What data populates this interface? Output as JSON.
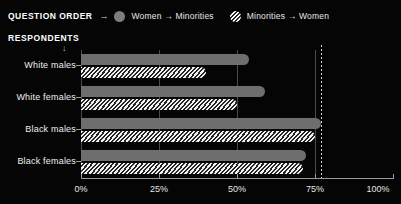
{
  "legend": {
    "title": "QUESTION ORDER",
    "arrow_icon": "→",
    "items": [
      {
        "label": "Women → Minorities",
        "swatch": "solid-circle",
        "color": "#7d7d7d"
      },
      {
        "label": "Minorities → Women",
        "swatch": "hatched-circle",
        "color": "#ffffff"
      }
    ]
  },
  "axis_group_title": "RESPONDENTS",
  "chart_data": {
    "type": "bar",
    "orientation": "horizontal",
    "title": "",
    "subtitle": "RESPONDENTS",
    "xlabel": "",
    "ylabel": "",
    "xlim": [
      0,
      100
    ],
    "xticks": [
      0,
      25,
      50,
      75,
      100
    ],
    "xtick_labels": [
      "0%",
      "25%",
      "50%",
      "75%",
      "100%"
    ],
    "grid": true,
    "grid_axis": "x",
    "legend_position": "top-left",
    "reference_line": {
      "value": 77,
      "style": "dotted",
      "color": "#d8d8d8"
    },
    "categories": [
      "White males",
      "White females",
      "Black males",
      "Black females"
    ],
    "series": [
      {
        "name": "Women → Minorities",
        "fill": "solid",
        "color": "#6e6e6e",
        "values": [
          54,
          59,
          77,
          72
        ]
      },
      {
        "name": "Minorities → Women",
        "fill": "hatched",
        "color": "#f2f2f2",
        "values": [
          40,
          50,
          75,
          71
        ]
      }
    ]
  },
  "xaxis": {
    "ticks": [
      {
        "value": 0,
        "label": "0%"
      },
      {
        "value": 25,
        "label": "25%"
      },
      {
        "value": 50,
        "label": "50%"
      },
      {
        "value": 75,
        "label": "75%"
      },
      {
        "value": 100,
        "label": "100%"
      }
    ]
  }
}
